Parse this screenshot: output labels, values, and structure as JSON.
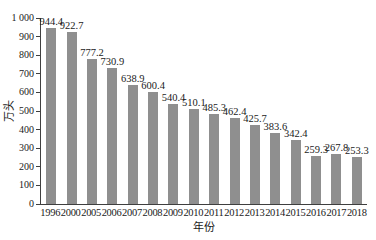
{
  "chart_data": {
    "type": "bar",
    "title": "",
    "xlabel": "年份",
    "ylabel": "万头",
    "categories": [
      "1996",
      "2000",
      "2005",
      "2006",
      "2007",
      "2008",
      "2009",
      "2010",
      "2011",
      "2012",
      "2013",
      "2014",
      "2015",
      "2016",
      "2017",
      "2018"
    ],
    "values": [
      944.4,
      922.7,
      777.2,
      730.9,
      638.9,
      600.4,
      540.4,
      510.1,
      485.3,
      462.4,
      425.7,
      383.6,
      342.4,
      259.3,
      267.8,
      253.3
    ],
    "data_labels": [
      "944.4",
      "922.7",
      "777.2",
      "730.9",
      "638.9",
      "600.4",
      "540.4",
      "510.1",
      "485.3",
      "462.4",
      "425.7",
      "383.6",
      "342.4",
      "259.3",
      "267.8",
      "253.3"
    ],
    "ylim": [
      0,
      1000
    ],
    "y_tick_step": 100,
    "y_tick_labels": [
      "0",
      "100",
      "200",
      "300",
      "400",
      "500",
      "600",
      "700",
      "800",
      "900",
      "1 000"
    ],
    "grid": false,
    "legend": "none",
    "bar_color": "#8f8f8f",
    "axis_color": "#3f3f3f",
    "text_color": "#1a1a1a"
  }
}
